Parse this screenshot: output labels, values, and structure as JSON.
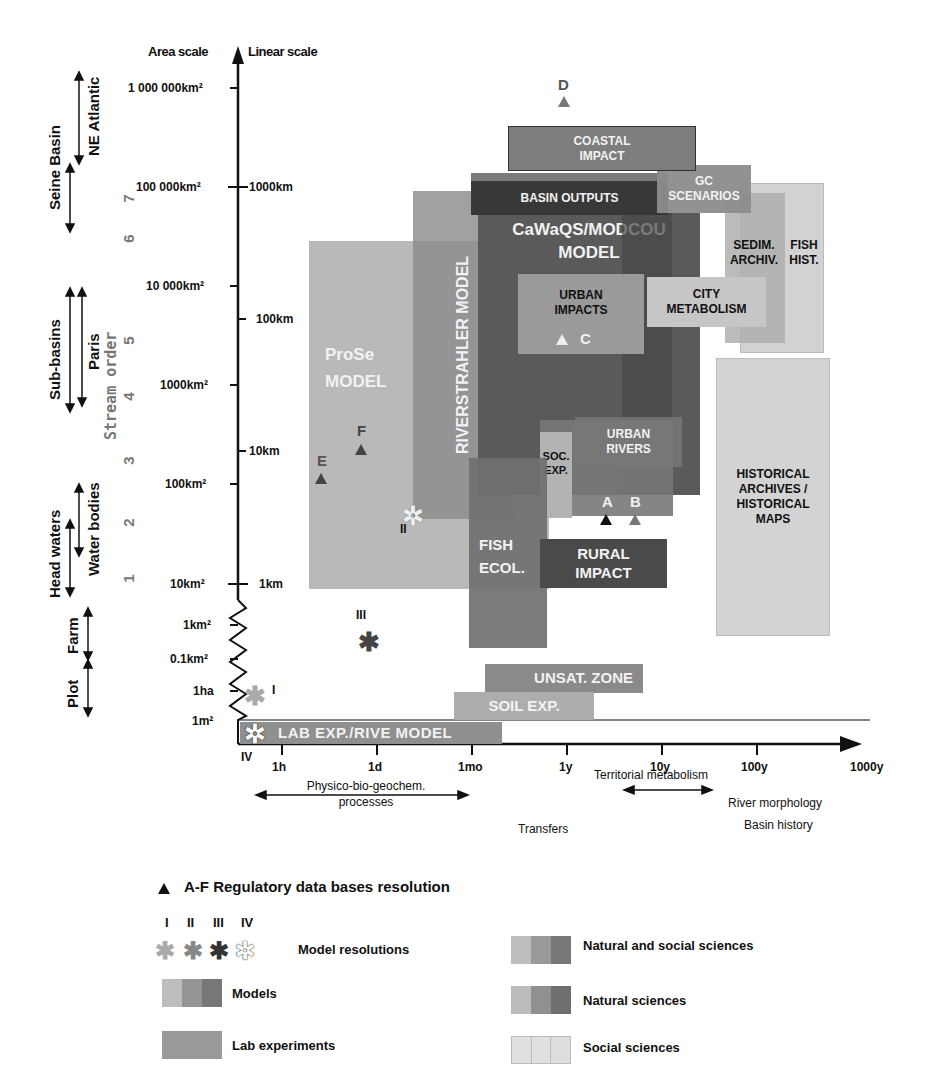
{
  "axes": {
    "y_title_left": "Area scale",
    "y_title_right": "Linear scale",
    "area_ticks": [
      "1 000 000km²",
      "100 000km²",
      "10 000km²",
      "1000km²",
      "100km²",
      "10km²",
      "1km²",
      "0.1km²",
      "1ha",
      "1m²"
    ],
    "linear_ticks": [
      "1000km",
      "100km",
      "10km",
      "1km"
    ],
    "x_ticks": [
      "1h",
      "1d",
      "1mo",
      "1y",
      "10y",
      "100y",
      "1000y"
    ],
    "stream_order_title": "Stream order",
    "stream_order_ticks": [
      "7",
      "6",
      "5",
      "4",
      "3",
      "2",
      "1"
    ]
  },
  "spatial_ranges": [
    {
      "label": "NE Atlantic"
    },
    {
      "label": "Seine Basin"
    },
    {
      "label": "Paris"
    },
    {
      "label": "Sub-basins"
    },
    {
      "label": "Water bodies"
    },
    {
      "label": "Head waters"
    },
    {
      "label": "Farm"
    },
    {
      "label": "Plot"
    }
  ],
  "temporal_ranges": [
    {
      "label": "Physico-bio-geochem.\nprocesses"
    },
    {
      "label": "Transfers"
    },
    {
      "label": "Territorial metabolism"
    },
    {
      "label": "River morphology"
    },
    {
      "label": "Basin history"
    }
  ],
  "boxes": {
    "coastal_impact": "COASTAL\nIMPACT",
    "basin_outputs": "BASIN OUTPUTS",
    "gc_scenarios": "GC\nSCENARIOS",
    "riverstrahler": "RIVERSTRAHLER MODEL",
    "cawaqs": "CaWaQS/MODCOU\nMODEL",
    "sedim_archiv": "SEDIM.\nARCHIV.",
    "fish_hist": "FISH\nHIST.",
    "urban_impacts": "URBAN\nIMPACTS",
    "city_metabolism": "CITY\nMETABOLISM",
    "prose": "ProSe\nMODEL",
    "urban_rivers": "URBAN\nRIVERS",
    "soc_exp": "SOC.\nEXP.",
    "historical": "HISTORICAL\nARCHIVES /\nHISTORICAL\nMAPS",
    "fish_ecol": "FISH\nECOL.",
    "rural_impact": "RURAL\nIMPACT",
    "unsat_zone": "UNSAT. ZONE",
    "soil_exp": "SOIL EXP.",
    "lab_exp": "LAB EXP./RIVE MODEL"
  },
  "markers": {
    "A": "A",
    "B": "B",
    "C": "C",
    "D": "D",
    "E": "E",
    "F": "F"
  },
  "resolutions": {
    "I": "I",
    "II": "II",
    "III": "III",
    "IV": "IV"
  },
  "legend": {
    "regulatory": "A-F Regulatory data bases resolution",
    "roman": [
      "I",
      "II",
      "III",
      "IV"
    ],
    "model_resolutions": "Model resolutions",
    "models": "Models",
    "lab_experiments": "Lab experiments",
    "natural_social": "Natural and social sciences",
    "natural": "Natural sciences",
    "social": "Social sciences"
  },
  "colors": {
    "light": "#b9b9b9",
    "mid": "#8f8f8f",
    "dark": "#5e5e5e",
    "darkest": "#3a3a3a",
    "social": "#d8d8d8"
  }
}
